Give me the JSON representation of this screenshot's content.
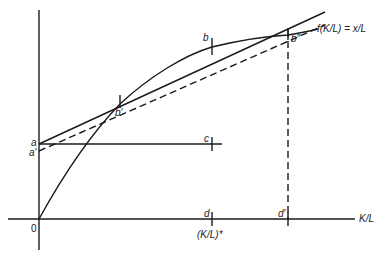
{
  "diagram": {
    "type": "economics-graph",
    "axes": {
      "x_label": "K/L",
      "origin_label": "0"
    },
    "points": {
      "a": "a",
      "a_prime": "a′",
      "b": "b",
      "b_prime": "b′",
      "b_double_prime": "b″",
      "c": "c",
      "d": "d",
      "d_prime": "d′"
    },
    "curve_label": "f(K/L) = x/L",
    "d_axis_label": "(K/L)*",
    "colors": {
      "stroke": "#1a1a1a",
      "background": "#ffffff"
    }
  }
}
